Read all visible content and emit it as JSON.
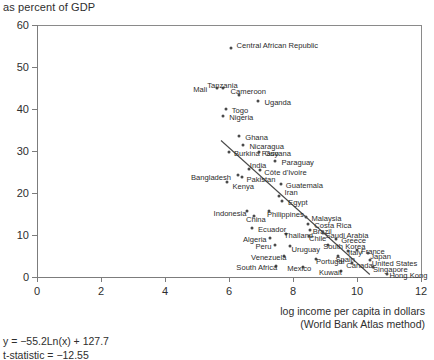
{
  "chart_title": "as percent of GDP",
  "axis": {
    "x_caption_line1": "log income per capita in dollars",
    "x_caption_line2": "(World Bank Atlas method)",
    "x_ticks": [
      "0",
      "2",
      "4",
      "6",
      "8",
      "10",
      "12"
    ],
    "y_ticks": [
      "0",
      "10",
      "20",
      "30",
      "40",
      "50",
      "60"
    ]
  },
  "stats": {
    "equation": "y = −55.2Ln(x) + 127.7",
    "tstat": "t-statistic = −12.55"
  },
  "chart_data": {
    "type": "scatter",
    "title": "as percent of GDP",
    "xlabel": "log income per capita in dollars (World Bank Atlas method)",
    "ylabel": "as percent of GDP",
    "xlim": [
      0,
      12
    ],
    "ylim": [
      0,
      60
    ],
    "grid": false,
    "legend": "none",
    "regression": {
      "equation": "y = −55.2Ln(x) + 127.7",
      "t_statistic": -12.55,
      "line_x": [
        5.75,
        10.4
      ],
      "line_y": [
        32.5,
        0.6
      ]
    },
    "points": [
      {
        "label": "Central African Republic",
        "x": 6.05,
        "y": 54.5,
        "lx": 6,
        "ly": -3.5
      },
      {
        "label": "Mali",
        "x": 5.63,
        "y": 45.0,
        "lx": -24,
        "ly": 1.2
      },
      {
        "label": "Tanzania",
        "x": 5.82,
        "y": 45.0,
        "lx": -16,
        "ly": -3.5
      },
      {
        "label": "Cameroon",
        "x": 6.3,
        "y": 43.4,
        "lx": -8,
        "ly": -3.5
      },
      {
        "label": "Uganda",
        "x": 6.92,
        "y": 42.0,
        "lx": 6,
        "ly": 1.2
      },
      {
        "label": "Togo",
        "x": 5.9,
        "y": 40.0,
        "lx": 6,
        "ly": 1.2
      },
      {
        "label": "Nigeria",
        "x": 5.82,
        "y": 38.4,
        "lx": 6,
        "ly": 1.2
      },
      {
        "label": "Ghana",
        "x": 6.32,
        "y": 33.6,
        "lx": 6,
        "ly": 1.2
      },
      {
        "label": "Nicaragua",
        "x": 6.45,
        "y": 31.4,
        "lx": 6,
        "ly": 1.2
      },
      {
        "label": "Burkina Faso",
        "x": 6.0,
        "y": 29.8,
        "lx": 5,
        "ly": 1.2
      },
      {
        "label": "Guyana",
        "x": 6.95,
        "y": 29.8,
        "lx": 5,
        "ly": 1.2
      },
      {
        "label": "Paraguay",
        "x": 7.45,
        "y": 27.6,
        "lx": 6,
        "ly": 1.2
      },
      {
        "label": "India",
        "x": 6.62,
        "y": 25.8,
        "lx": 1,
        "ly": -3.5
      },
      {
        "label": "Côte d'Ivoire",
        "x": 6.98,
        "y": 25.4,
        "lx": 4,
        "ly": 1.2
      },
      {
        "label": "Bangladesh",
        "x": 6.28,
        "y": 24.2,
        "lx": -47,
        "ly": 1.2
      },
      {
        "label": "Pakistan",
        "x": 6.42,
        "y": 23.8,
        "lx": 4,
        "ly": 1.8
      },
      {
        "label": "Guatemala",
        "x": 7.62,
        "y": 22.2,
        "lx": 5,
        "ly": 1.2
      },
      {
        "label": "Iran",
        "x": 7.55,
        "y": 19.4,
        "lx": 6,
        "ly": -3.2
      },
      {
        "label": "Egypt",
        "x": 7.66,
        "y": 18.2,
        "lx": 6,
        "ly": 1.2
      },
      {
        "label": "Kenya",
        "x": 5.95,
        "y": 22.6,
        "lx": 5,
        "ly": 3.6
      },
      {
        "label": "Indonesia",
        "x": 6.55,
        "y": 15.6,
        "lx": -33,
        "ly": 1.2
      },
      {
        "label": "China",
        "x": 6.78,
        "y": 14.6,
        "lx": -8,
        "ly": 3.4
      },
      {
        "label": "Philippines",
        "x": 7.25,
        "y": 15.6,
        "lx": -2,
        "ly": 2.6
      },
      {
        "label": "Ecuador",
        "x": 6.72,
        "y": 11.6,
        "lx": 6,
        "ly": 1.2
      },
      {
        "label": "Malaysia",
        "x": 8.42,
        "y": 14.4,
        "lx": 5,
        "ly": 1.2
      },
      {
        "label": "Costa Rica",
        "x": 8.48,
        "y": 12.6,
        "lx": 6,
        "ly": 1.2
      },
      {
        "label": "Brazil",
        "x": 8.52,
        "y": 11.2,
        "lx": 3,
        "ly": 1.2
      },
      {
        "label": "Thailand",
        "x": 7.78,
        "y": 10.2,
        "lx": -2,
        "ly": 1.2
      },
      {
        "label": "Chile",
        "x": 8.5,
        "y": 9.8,
        "lx": 0,
        "ly": 2.4
      },
      {
        "label": "Saudi Arabia",
        "x": 8.95,
        "y": 10.4,
        "lx": 2,
        "ly": 1.2
      },
      {
        "label": "Algeria",
        "x": 7.28,
        "y": 9.4,
        "lx": -27,
        "ly": 1.2
      },
      {
        "label": "Greece",
        "x": 9.35,
        "y": 9.0,
        "lx": 5,
        "ly": 1.2
      },
      {
        "label": "Peru",
        "x": 7.45,
        "y": 7.6,
        "lx": -20,
        "ly": 1.2
      },
      {
        "label": "Uruguay",
        "x": 7.92,
        "y": 7.4,
        "lx": 1,
        "ly": 2.6
      },
      {
        "label": "South Korea",
        "x": 9.1,
        "y": 7.6,
        "lx": -5,
        "ly": 1.2
      },
      {
        "label": "Italy",
        "x": 9.72,
        "y": 6.2,
        "lx": 0,
        "ly": 1.2
      },
      {
        "label": "France",
        "x": 10.0,
        "y": 6.4,
        "lx": 4,
        "ly": 1.0
      },
      {
        "label": "Japan",
        "x": 10.35,
        "y": 5.6,
        "lx": 2,
        "ly": 2.4
      },
      {
        "label": "Venezuela",
        "x": 7.72,
        "y": 5.0,
        "lx": -33,
        "ly": 1.2
      },
      {
        "label": "Portugal",
        "x": 8.72,
        "y": 4.4,
        "lx": 0,
        "ly": 2.4
      },
      {
        "label": "Spain",
        "x": 9.42,
        "y": 5.0,
        "lx": -3,
        "ly": 2.6
      },
      {
        "label": "United States",
        "x": 10.4,
        "y": 4.0,
        "lx": 2,
        "ly": 2.4
      },
      {
        "label": "Canada",
        "x": 9.85,
        "y": 3.4,
        "lx": -6,
        "ly": 2.4
      },
      {
        "label": "Singapore",
        "x": 10.5,
        "y": 2.4,
        "lx": 0,
        "ly": 2.4
      },
      {
        "label": "South Africa",
        "x": 7.48,
        "y": 2.6,
        "lx": -40,
        "ly": 1.2
      },
      {
        "label": "Mexico",
        "x": 8.32,
        "y": 2.4,
        "lx": -16,
        "ly": 1.2
      },
      {
        "label": "Kuwait",
        "x": 9.5,
        "y": 1.4,
        "lx": -22,
        "ly": 1.0
      },
      {
        "label": "Hong Kong",
        "x": 10.95,
        "y": 0.8,
        "lx": 2,
        "ly": 1.6
      }
    ]
  }
}
